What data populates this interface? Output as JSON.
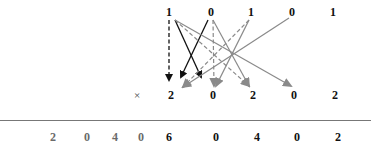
{
  "multiplicand": {
    "digits": [
      "1",
      "0",
      "1",
      "0",
      "1"
    ],
    "x": [
      169,
      211,
      251,
      292,
      333
    ],
    "y": 12
  },
  "multiplier": {
    "operator": "×",
    "operator_x": 137,
    "digits": [
      "2",
      "0",
      "2",
      "0",
      "2"
    ],
    "x": [
      171,
      213,
      253,
      294,
      335
    ],
    "y": 95
  },
  "result": {
    "digits": [
      "2",
      "0",
      "4",
      "0",
      "6",
      "0",
      "4",
      "0",
      "2"
    ],
    "x": [
      53,
      87,
      115,
      141,
      169,
      216,
      257,
      297,
      338
    ],
    "gray_indices": [
      0,
      1,
      2,
      3
    ],
    "y": 137
  },
  "colors": {
    "black_arrow": "#111111",
    "gray_arrow": "#8a8a8a",
    "rule": "#777777",
    "gray_text": "#6a6a6a"
  },
  "arrows": [
    {
      "from": [
        169,
        20
      ],
      "to": [
        169,
        80
      ],
      "style": "dashed",
      "color": "black"
    },
    {
      "from": [
        208,
        20
      ],
      "to": [
        181,
        77
      ],
      "style": "solid",
      "color": "black"
    },
    {
      "from": [
        175,
        20
      ],
      "to": [
        201,
        77
      ],
      "style": "solid",
      "color": "black"
    },
    {
      "from": [
        249,
        20
      ],
      "to": [
        183,
        87
      ],
      "style": "dashed",
      "color": "gray"
    },
    {
      "from": [
        213,
        20
      ],
      "to": [
        214,
        86
      ],
      "style": "dashed",
      "color": "gray"
    },
    {
      "from": [
        249,
        20
      ],
      "to": [
        216,
        86
      ],
      "style": "solid",
      "color": "gray"
    },
    {
      "from": [
        175,
        20
      ],
      "to": [
        249,
        86
      ],
      "style": "dashed",
      "color": "gray"
    },
    {
      "from": [
        213,
        20
      ],
      "to": [
        249,
        86
      ],
      "style": "solid",
      "color": "gray"
    },
    {
      "from": [
        175,
        20
      ],
      "to": [
        291,
        86
      ],
      "style": "solid",
      "color": "gray"
    },
    {
      "from": [
        289,
        18
      ],
      "to": [
        183,
        87
      ],
      "style": "solid",
      "color": "gray"
    }
  ]
}
